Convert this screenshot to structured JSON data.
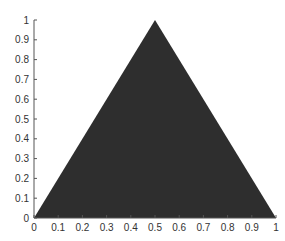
{
  "chart_data": {
    "type": "area",
    "title": "",
    "xlabel": "",
    "ylabel": "",
    "xlim": [
      0,
      1
    ],
    "ylim": [
      0,
      1
    ],
    "grid": false,
    "legend": null,
    "series": [
      {
        "name": "triangle",
        "x": [
          0,
          0.5,
          1
        ],
        "y": [
          0,
          1,
          0
        ],
        "fill": "#2e2e2e"
      }
    ],
    "xticks": [
      "0",
      "0.1",
      "0.2",
      "0.3",
      "0.4",
      "0.5",
      "0.6",
      "0.7",
      "0.8",
      "0.9",
      "1"
    ],
    "yticks": [
      "0",
      "0.1",
      "0.2",
      "0.3",
      "0.4",
      "0.5",
      "0.6",
      "0.7",
      "0.8",
      "0.9",
      "1"
    ]
  },
  "colors": {
    "fill": "#2e2e2e",
    "axis": "#555555",
    "text": "#333333"
  }
}
